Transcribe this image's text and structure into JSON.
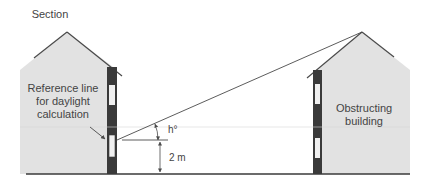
{
  "diagram": {
    "title": "Section",
    "left_building": {
      "label_lines": [
        "Reference line",
        "for daylight",
        "calculation"
      ]
    },
    "right_building": {
      "label_lines": [
        "Obstructing",
        "building"
      ]
    },
    "angle_label": "h°",
    "height_label": "2 m",
    "colors": {
      "building_fill": "#e2e2e2",
      "wall": "#3a3a3a",
      "window": "#f0f0f0",
      "line": "#4a4a4a",
      "text": "#444444"
    }
  }
}
